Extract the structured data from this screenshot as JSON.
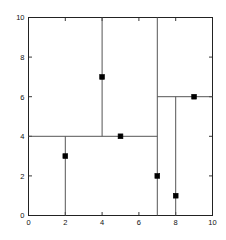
{
  "chart_data": {
    "type": "scatter",
    "title": "",
    "subtitle": "",
    "xlabel": "",
    "ylabel": "",
    "xlim": [
      0,
      10
    ],
    "ylim": [
      0,
      10
    ],
    "grid": false,
    "legend": null,
    "xticks": [
      0,
      2,
      4,
      6,
      8,
      10
    ],
    "yticks": [
      0,
      2,
      4,
      6,
      8,
      10
    ],
    "xtick_labels": [
      "0",
      "2",
      "4",
      "6",
      "8",
      "10"
    ],
    "ytick_labels": [
      "0",
      "2",
      "4",
      "6",
      "8",
      "10"
    ],
    "point_color": "#000000",
    "line_color": "#555555",
    "axis_color": "#222222",
    "background_color": "#ffffff",
    "points": [
      {
        "label": "p1",
        "x": 2,
        "y": 3
      },
      {
        "label": "p2",
        "x": 4,
        "y": 7
      },
      {
        "label": "p3",
        "x": 5,
        "y": 4
      },
      {
        "label": "p4",
        "x": 7,
        "y": 2
      },
      {
        "label": "p5",
        "x": 8,
        "y": 1
      },
      {
        "label": "p6",
        "x": 9,
        "y": 6
      }
    ],
    "partition_lines": [
      {
        "label": "split-x-7",
        "orientation": "vertical",
        "at": 7,
        "from": 0,
        "to": 10
      },
      {
        "label": "split-y-4",
        "orientation": "horizontal",
        "at": 4,
        "from": 0,
        "to": 7
      },
      {
        "label": "split-x-4",
        "orientation": "vertical",
        "at": 4,
        "from": 4,
        "to": 10
      },
      {
        "label": "split-x-2",
        "orientation": "vertical",
        "at": 2,
        "from": 0,
        "to": 4
      },
      {
        "label": "split-y-6",
        "orientation": "horizontal",
        "at": 6,
        "from": 7,
        "to": 10
      },
      {
        "label": "split-x-8",
        "orientation": "vertical",
        "at": 8,
        "from": 0,
        "to": 6
      }
    ]
  }
}
